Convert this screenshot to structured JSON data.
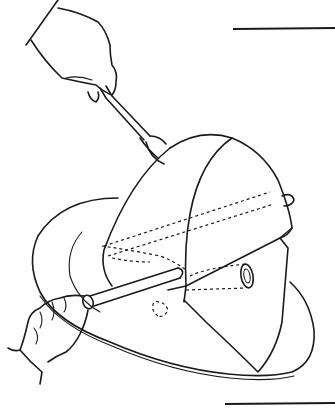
{
  "illustration": {
    "subject": "Carving a ham on a platter",
    "elements": [
      "hand holding carving fork",
      "ham",
      "platter",
      "hand holding carving knife",
      "bone end"
    ],
    "colors": {
      "ink": "#1a1a1a",
      "paper": "#ffffff"
    }
  }
}
